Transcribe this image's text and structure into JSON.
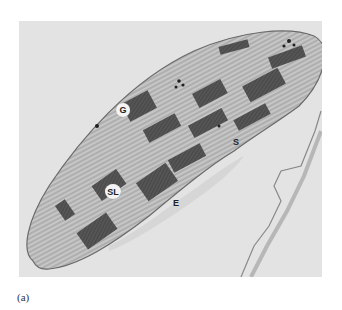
{
  "figure": {
    "type": "transmission electron micrograph",
    "caption": "(a)",
    "labels": [
      {
        "id": "G",
        "text": "G",
        "x": 123,
        "y": 110
      },
      {
        "id": "S",
        "text": "S",
        "x": 236,
        "y": 142
      },
      {
        "id": "SL",
        "text": "SL",
        "x": 113,
        "y": 192
      },
      {
        "id": "E",
        "text": "E",
        "x": 176,
        "y": 203
      }
    ],
    "colors": {
      "background": "#e3e3e3",
      "stroma": "#cfcfcf",
      "grana": "#4a4a4a",
      "membrane": "#6a6a6a"
    }
  }
}
